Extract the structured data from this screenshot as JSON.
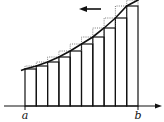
{
  "diagram": {
    "type": "riemann_sum_left_endpoint",
    "labels": {
      "a": "a",
      "b": "b"
    },
    "axis": {
      "y": 106,
      "x_start": 4,
      "x_end": 162
    },
    "interval": {
      "a_x": 25,
      "b_x": 138,
      "n": 10
    },
    "rect_lefts": [
      25,
      36.3,
      47.6,
      58.9,
      70.2,
      81.5,
      92.8,
      104.1,
      115.4,
      126.7
    ],
    "rect_width": 11.3,
    "left_heights_y": [
      69,
      66,
      62,
      57,
      51,
      44,
      37,
      28,
      18,
      6
    ],
    "right_heights_y": [
      66,
      62,
      57,
      51,
      44,
      37,
      28,
      18,
      6,
      0
    ],
    "arrow": {
      "x1": 101,
      "x2": 79,
      "y": 9,
      "direction": "left"
    },
    "colors": {
      "stroke": "#111111",
      "dotted": "#555555",
      "background": "#ffffff"
    }
  }
}
